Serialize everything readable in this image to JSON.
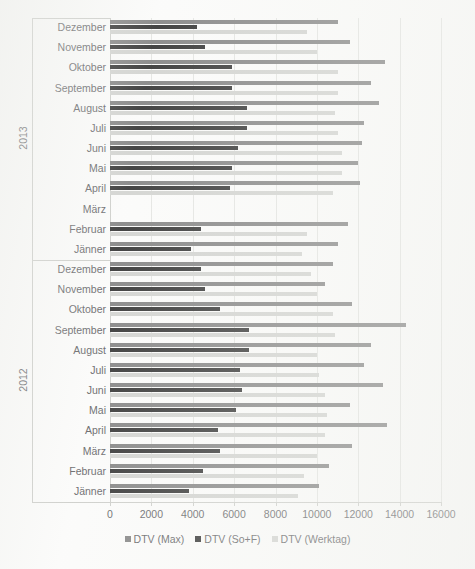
{
  "chart_data": {
    "type": "bar",
    "orientation": "horizontal",
    "title": "",
    "xlabel": "",
    "ylabel": "",
    "xlim": [
      0,
      16000
    ],
    "xticks": [
      0,
      2000,
      4000,
      6000,
      8000,
      10000,
      12000,
      14000,
      16000
    ],
    "xtick_labels": [
      "0",
      "2000",
      "4000",
      "6000",
      "8000",
      "10000",
      "12000",
      "14000",
      "16000"
    ],
    "grid": true,
    "legend_position": "bottom",
    "groups": [
      "2013",
      "2012"
    ],
    "categories": [
      "Dezember",
      "November",
      "Oktober",
      "September",
      "August",
      "Juli",
      "Juni",
      "Mai",
      "April",
      "März",
      "Februar",
      "Jänner"
    ],
    "series": [
      {
        "name": "DTV (Max)",
        "color": "#7b7b7b",
        "values_2013": [
          11000,
          11600,
          13300,
          12600,
          13000,
          12300,
          12200,
          12000,
          12100,
          null,
          11500,
          11000
        ],
        "values_2012": [
          10800,
          10400,
          11700,
          14300,
          12600,
          12300,
          13200,
          11600,
          13400,
          11700,
          10600,
          10100
        ]
      },
      {
        "name": "DTV (So+F)",
        "color": "#252525",
        "values_2013": [
          4200,
          4600,
          5900,
          5900,
          6600,
          6600,
          6200,
          5900,
          5800,
          null,
          4400,
          3900
        ],
        "values_2012": [
          4400,
          4600,
          5300,
          6700,
          6700,
          6300,
          6400,
          6100,
          5200,
          5300,
          4500,
          3800
        ]
      },
      {
        "name": "DTV (Werktag)",
        "color": "#cfd0cd",
        "values_2013": [
          9500,
          10000,
          11000,
          11000,
          10900,
          11000,
          11200,
          11200,
          10800,
          null,
          9500,
          9300
        ],
        "values_2012": [
          9700,
          10000,
          10800,
          10900,
          10000,
          10100,
          10400,
          10500,
          10400,
          10000,
          9400,
          9100
        ]
      }
    ]
  },
  "legend": {
    "items": [
      {
        "label": "DTV (Max)",
        "color": "#7b7b7b"
      },
      {
        "label": "DTV (So+F)",
        "color": "#252525"
      },
      {
        "label": "DTV (Werktag)",
        "color": "#cfd0cd"
      }
    ]
  }
}
